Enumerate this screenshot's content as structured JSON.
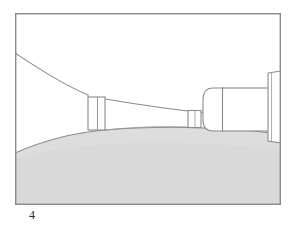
{
  "figure": {
    "caption_label": "4",
    "canvas": {
      "width": 291,
      "height": 233
    },
    "frame": {
      "x": 15,
      "y": 13,
      "width": 266,
      "height": 192,
      "stroke_color": "#8a8a8a",
      "stroke_width": 1.4,
      "fill_color": "#ffffff"
    },
    "colors": {
      "outline": "#8a8a8a",
      "outline_dark": "#7a7a7a",
      "ground_fill": "#d9d9d9",
      "ground_fill_light": "#dedede",
      "part_fill": "#ffffff",
      "caption_text": "#2b2b2b",
      "page_background": "#ffffff"
    },
    "parts": [
      {
        "id": "upper-flare-curve",
        "name": "upper flared contour",
        "description": "Concave curve descending from the left frame edge toward the first collar"
      },
      {
        "id": "left-collar",
        "name": "left cylindrical collar",
        "x": 88,
        "width": 17,
        "top": 97
      },
      {
        "id": "tapered-shaft",
        "name": "tapered shaft",
        "description": "Gently tapering body between the left collar and the small right collar"
      },
      {
        "id": "small-collar",
        "name": "small cylindrical collar",
        "x": 188,
        "width": 13,
        "top": 110
      },
      {
        "id": "rounded-shoulder",
        "name": "rounded shoulder nose",
        "x": 203,
        "width": 20,
        "top": 88
      },
      {
        "id": "main-block",
        "name": "main rectangular body",
        "x": 222,
        "width": 46,
        "top": 88
      },
      {
        "id": "right-flange",
        "name": "right vertical flange",
        "x": 267,
        "width": 14,
        "top": 73,
        "bottom": 141
      },
      {
        "id": "ground-region",
        "name": "shaded ground region",
        "description": "Light gray shaded area rising from the lower left and flattening toward the right"
      }
    ]
  }
}
